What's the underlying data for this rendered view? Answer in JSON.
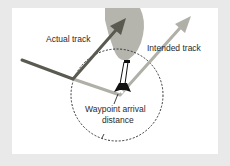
{
  "diagram": {
    "labels": {
      "actual_track": "Actual track",
      "intended_track": "Intended track",
      "waypoint_line1": "Waypoint arrival",
      "waypoint_line2": "distance"
    },
    "colors": {
      "frame": "#e9e9e9",
      "panel": "#ffffff",
      "obstacle": "#b5b5ae",
      "actual_track": "#5a5a50",
      "intended_track": "#b0b0a8",
      "circle": "#333333",
      "aircraft": "#111111",
      "text": "#2a2a2a"
    }
  }
}
